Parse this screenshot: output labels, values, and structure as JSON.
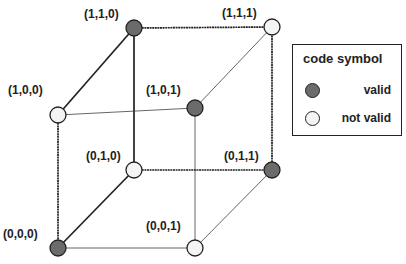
{
  "colors": {
    "valid": "#6b6b6b",
    "not_valid": "#f4f4f4",
    "stroke": "#222222",
    "thin_edge": "#555555"
  },
  "vertices": [
    {
      "label": "(0,0,0)",
      "state": "valid"
    },
    {
      "label": "(0,0,1)",
      "state": "not_valid"
    },
    {
      "label": "(0,1,0)",
      "state": "not_valid"
    },
    {
      "label": "(0,1,1)",
      "state": "valid"
    },
    {
      "label": "(1,0,0)",
      "state": "not_valid"
    },
    {
      "label": "(1,0,1)",
      "state": "valid"
    },
    {
      "label": "(1,1,0)",
      "state": "valid"
    },
    {
      "label": "(1,1,1)",
      "state": "not_valid"
    }
  ],
  "legend": {
    "title": "code symbol",
    "items": [
      {
        "label": "valid",
        "state": "valid"
      },
      {
        "label": "not valid",
        "state": "not_valid"
      }
    ]
  }
}
